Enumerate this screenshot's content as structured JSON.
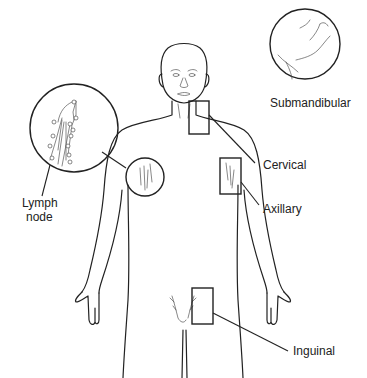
{
  "diagram": {
    "type": "anatomical-illustration",
    "labels": {
      "submandibular": "Submandibular",
      "cervical": "Cervical",
      "axillary": "Axillary",
      "inguinal": "Inguinal",
      "lymph_node_line1": "Lymph",
      "lymph_node_line2": "node"
    },
    "regions": [
      {
        "name": "Submandibular",
        "marker": "circle-inset",
        "location": "under jaw"
      },
      {
        "name": "Cervical",
        "marker": "rectangle",
        "location": "neck"
      },
      {
        "name": "Axillary",
        "marker": "rectangle",
        "location": "left armpit (viewer's right)"
      },
      {
        "name": "Inguinal",
        "marker": "rectangle",
        "location": "groin"
      },
      {
        "name": "Lymph node",
        "marker": "circle-magnified-inset",
        "location": "right armpit (viewer's left)"
      }
    ],
    "colors": {
      "line": "#222222",
      "background": "#ffffff"
    }
  }
}
